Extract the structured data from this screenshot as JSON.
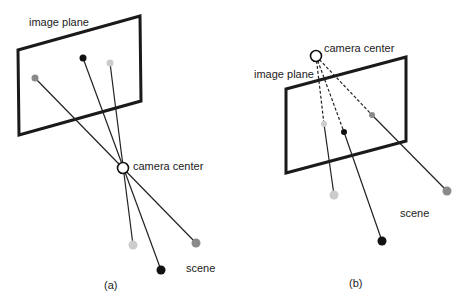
{
  "panel_a": {
    "image_plane_label": "image plane",
    "camera_center_label": "camera center",
    "scene_label": "scene",
    "caption": "(a)"
  },
  "panel_b": {
    "image_plane_label": "image plane",
    "camera_center_label": "camera center",
    "scene_label": "scene",
    "caption": "(b)"
  },
  "colors": {
    "black": "#111111",
    "gray": "#8a8a8a",
    "light": "#cccccc",
    "frame": "#1a1a1a"
  }
}
